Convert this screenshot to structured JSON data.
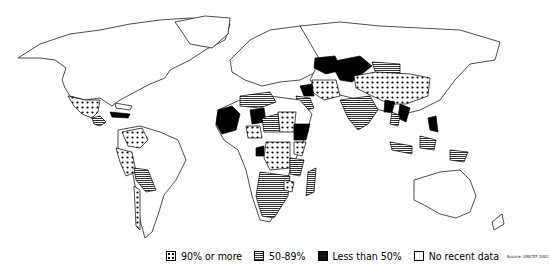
{
  "map": {
    "subject": "World map of country coverage levels",
    "categories": [
      {
        "id": "high",
        "label": "90% or more",
        "pattern": "dots",
        "color": "#000000"
      },
      {
        "id": "mid",
        "label": "50-89%",
        "pattern": "horizontal-lines",
        "color": "#555555"
      },
      {
        "id": "low",
        "label": "Less than 50%",
        "pattern": "solid",
        "color": "#111111"
      },
      {
        "id": "none",
        "label": "No recent data",
        "pattern": "empty",
        "color": "#ffffff"
      }
    ],
    "source": "Source: UNICEF 2001"
  },
  "legend": {
    "high": "90% or more",
    "mid": "50-89%",
    "low": "Less than 50%",
    "none": "No recent data",
    "source": "Source: UNICEF 2001"
  }
}
